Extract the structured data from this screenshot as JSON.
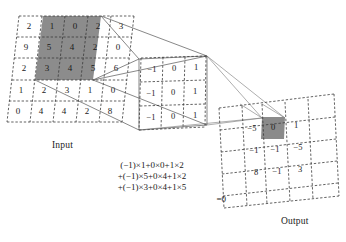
{
  "figure": {
    "type": "convolution-diagram",
    "input_label": "Input",
    "output_label": "Output"
  },
  "input": {
    "label": "Input",
    "rows": 5,
    "cols": 5,
    "values": [
      [
        "2",
        "1",
        "0",
        "2",
        "3"
      ],
      [
        "9",
        "5",
        "4",
        "2",
        "0"
      ],
      [
        "2",
        "3",
        "4",
        "5",
        "6"
      ],
      [
        "1",
        "2",
        "3",
        "1",
        "0"
      ],
      [
        "0",
        "4",
        "4",
        "2",
        "8"
      ]
    ],
    "highlight": {
      "row_start": 0,
      "col_start": 1,
      "rows": 3,
      "cols": 3,
      "values": [
        [
          "1",
          "0",
          "2"
        ],
        [
          "5",
          "4",
          "2"
        ],
        [
          "3",
          "4",
          "5"
        ]
      ]
    }
  },
  "kernel": {
    "rows": 3,
    "cols": 3,
    "values": [
      [
        "−1",
        "0",
        "1"
      ],
      [
        "−1",
        "0",
        "1"
      ],
      [
        "−1",
        "0",
        "1"
      ]
    ]
  },
  "output": {
    "label": "Output",
    "rows": 3,
    "cols": 3,
    "values": [
      [
        "−5",
        "0",
        "1"
      ],
      [
        "−1",
        "−1",
        "−5"
      ],
      [
        "8",
        "−1",
        "3"
      ]
    ],
    "highlight": {
      "row": 0,
      "col": 1,
      "value": "0"
    }
  },
  "formula": {
    "line1": "(−1)×1+0×0+1×2",
    "line2": "+(−1)×5+0×4+1×2",
    "line3": "+(−1)×3+0×4+1×5",
    "line4": "=0"
  },
  "colors": {
    "highlight_fill": "#8c8c8c",
    "grid_stroke": "#3a3a3a",
    "projection_stroke": "#777777",
    "text": "#1a1a1a",
    "background": "#ffffff"
  }
}
